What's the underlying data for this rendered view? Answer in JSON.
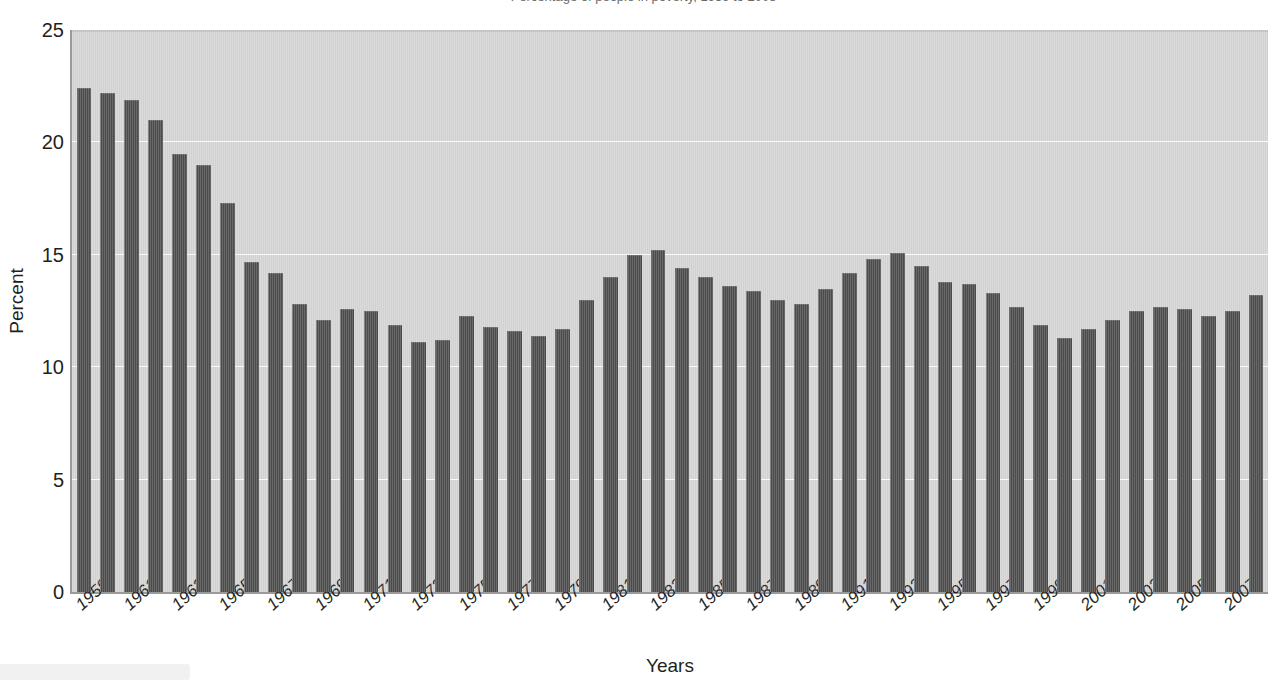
{
  "figure": {
    "clipped_title": "Percentage of people in poverty, 1959 to 2008",
    "bottom_band_label": ""
  },
  "chart_data": {
    "type": "bar",
    "title": "",
    "xlabel": "Years",
    "ylabel": "Percent",
    "ylim": [
      0,
      25
    ],
    "yticks": [
      0,
      5,
      10,
      15,
      20,
      25
    ],
    "ytick_labels": [
      "0",
      "5",
      "10",
      "15",
      "20",
      "25"
    ],
    "grid": true,
    "grid_axis": "y",
    "legend": false,
    "bar_color": "#4c4c4c",
    "plot_background": "#d4d4d4",
    "gridline_color": "#fbfbfb",
    "axis_color": "#9a9a9a",
    "text_color": "#231f20",
    "xtick_label_rotation": -42,
    "xtick_label_step": 2,
    "categories": [
      "1959",
      "1960",
      "1961",
      "1962",
      "1963",
      "1964",
      "1965",
      "1966",
      "1967",
      "1968",
      "1969",
      "1970",
      "1971",
      "1972",
      "1973",
      "1974",
      "1975",
      "1976",
      "1977",
      "1978",
      "1979",
      "1980",
      "1981",
      "1982",
      "1983",
      "1984",
      "1985",
      "1986",
      "1987",
      "1988",
      "1989",
      "1990",
      "1991",
      "1992",
      "1993",
      "1994",
      "1995",
      "1996",
      "1997",
      "1998",
      "1999",
      "2000",
      "2001",
      "2002",
      "2003",
      "2004",
      "2005",
      "2006",
      "2007",
      "2008"
    ],
    "visible_xtick_labels": [
      "1959",
      "1961",
      "1963",
      "1965",
      "1967",
      "1969",
      "1971",
      "1973",
      "1975",
      "1977",
      "1979",
      "1981",
      "1983",
      "1985",
      "1987",
      "1989",
      "1991",
      "1993",
      "1995",
      "1997",
      "1999",
      "2001",
      "2003",
      "2005",
      "2007"
    ],
    "values": [
      22.4,
      22.2,
      21.9,
      21.0,
      19.5,
      19.0,
      17.3,
      14.7,
      14.2,
      12.8,
      12.1,
      12.6,
      12.5,
      11.9,
      11.1,
      11.2,
      12.3,
      11.8,
      11.6,
      11.4,
      11.7,
      13.0,
      14.0,
      15.0,
      15.2,
      14.4,
      14.0,
      13.6,
      13.4,
      13.0,
      12.8,
      13.5,
      14.2,
      14.8,
      15.1,
      14.5,
      13.8,
      13.7,
      13.3,
      12.7,
      11.9,
      11.3,
      11.7,
      12.1,
      12.5,
      12.7,
      12.6,
      12.3,
      12.5,
      13.2
    ],
    "units": "percent"
  }
}
